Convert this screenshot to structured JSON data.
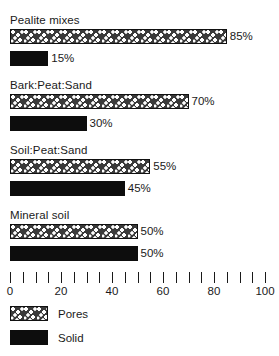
{
  "chart_data": {
    "type": "bar",
    "title": "",
    "subtitle": "",
    "xlabel": "",
    "ylabel": "",
    "orientation": "horizontal",
    "xlim": [
      0,
      100
    ],
    "xticks": [
      0,
      5,
      10,
      15,
      20,
      25,
      30,
      35,
      40,
      45,
      50,
      55,
      60,
      65,
      70,
      75,
      80,
      85,
      90,
      95,
      100
    ],
    "xtick_labels": [
      "0",
      "",
      "",
      "",
      "20",
      "",
      "",
      "",
      "40",
      "",
      "",
      "",
      "60",
      "",
      "",
      "",
      "80",
      "",
      "",
      "",
      "100"
    ],
    "major_tick_values": [
      0,
      20,
      40,
      60,
      80,
      100
    ],
    "grid": false,
    "categories": [
      "Pealite mixes",
      "Bark:Peat:Sand",
      "Soil:Peat:Sand",
      "Mineral soil"
    ],
    "series": [
      {
        "name": "Pores",
        "values": [
          85,
          70,
          55,
          50
        ],
        "style": "stippled"
      },
      {
        "name": "Solid",
        "values": [
          15,
          30,
          45,
          50
        ],
        "style": "black"
      }
    ],
    "groups": [
      {
        "label": "Pealite mixes",
        "bars": [
          {
            "series": "Pores",
            "value": 85,
            "value_label": "85%"
          },
          {
            "series": "Solid",
            "value": 15,
            "value_label": "15%"
          }
        ]
      },
      {
        "label": "Bark:Peat:Sand",
        "bars": [
          {
            "series": "Pores",
            "value": 70,
            "value_label": "70%"
          },
          {
            "series": "Solid",
            "value": 30,
            "value_label": "30%"
          }
        ]
      },
      {
        "label": "Soil:Peat:Sand",
        "bars": [
          {
            "series": "Pores",
            "value": 55,
            "value_label": "55%"
          },
          {
            "series": "Solid",
            "value": 45,
            "value_label": "45%"
          }
        ]
      },
      {
        "label": "Mineral soil",
        "bars": [
          {
            "series": "Pores",
            "value": 50,
            "value_label": "50%"
          },
          {
            "series": "Solid",
            "value": 50,
            "value_label": "50%"
          }
        ]
      }
    ],
    "legend": {
      "position": "bottom-left",
      "entries": [
        {
          "label": "Pores",
          "style": "stippled",
          "color": "#3a3a3a"
        },
        {
          "label": "Solid",
          "style": "black",
          "color": "#0d0d0d"
        }
      ]
    },
    "colors": {
      "pores_fill": "#3a3a3a",
      "pores_speckle": "#ffffff",
      "solid_fill": "#0d0d0d",
      "text": "#1a1a1a",
      "background": "#ffffff"
    }
  }
}
